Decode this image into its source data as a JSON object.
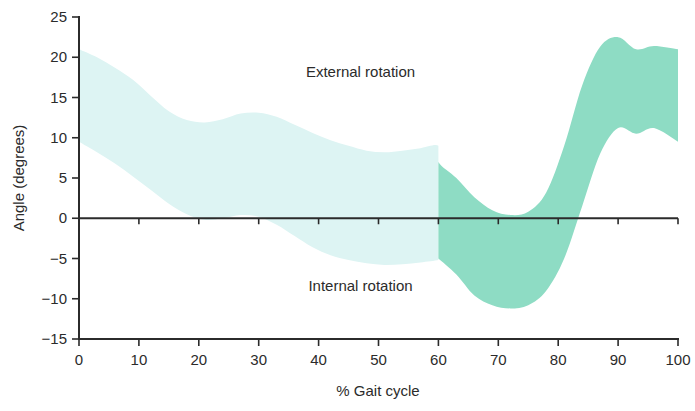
{
  "chart_data": {
    "type": "area",
    "title": "",
    "subtitle": "",
    "xlabel": "% Gait cycle",
    "ylabel": "Angle (degrees)",
    "xlim": [
      0,
      100
    ],
    "ylim": [
      -15,
      25
    ],
    "xticks": [
      0,
      10,
      20,
      30,
      40,
      50,
      60,
      70,
      80,
      90,
      100
    ],
    "xtick_labels": [
      "0",
      "10",
      "20",
      "30",
      "40",
      "50",
      "60",
      "70",
      "80",
      "90",
      "100"
    ],
    "yticks": [
      -15,
      -10,
      -5,
      0,
      5,
      10,
      15,
      20,
      25
    ],
    "ytick_labels": [
      "−15",
      "−10",
      "−5",
      "0",
      "5",
      "10",
      "15",
      "20",
      "25"
    ],
    "grid": false,
    "legend": null,
    "zero_reference_line": 0,
    "annotations": [
      {
        "text": "External rotation",
        "x": 47,
        "y": 17.5,
        "name": "external-rotation-label"
      },
      {
        "text": "Internal rotation",
        "x": 47,
        "y": -9.0,
        "name": "internal-rotation-label"
      }
    ],
    "colors": {
      "band_stance": "#ddf4f3",
      "band_swing": "#8edcc4",
      "axis": "#2b2b2b",
      "text": "#2b2b2b",
      "background": "#ffffff"
    },
    "phase_split_x": 60,
    "series": [
      {
        "name": "Hip/knee rotation normal range (upper bound)",
        "x": [
          0,
          3,
          6,
          9,
          12,
          15,
          18,
          21,
          24,
          27,
          30,
          33,
          36,
          39,
          42,
          45,
          48,
          51,
          54,
          57,
          60,
          60,
          63,
          66,
          69,
          72,
          75,
          78,
          81,
          84,
          87,
          90,
          93,
          96,
          100
        ],
        "values": [
          21.0,
          20.0,
          18.7,
          17.2,
          15.2,
          13.3,
          12.2,
          11.9,
          12.3,
          13.0,
          13.1,
          12.6,
          11.6,
          10.6,
          9.7,
          9.0,
          8.4,
          8.2,
          8.4,
          8.7,
          9.0,
          7.0,
          5.0,
          2.6,
          1.0,
          0.4,
          0.8,
          3.2,
          9.0,
          16.5,
          21.3,
          22.5,
          21.0,
          21.4,
          21.0
        ]
      },
      {
        "name": "Hip/knee rotation normal range (lower bound)",
        "x": [
          0,
          3,
          6,
          9,
          12,
          15,
          18,
          21,
          24,
          27,
          30,
          33,
          36,
          39,
          42,
          45,
          48,
          51,
          54,
          57,
          60,
          60,
          63,
          66,
          69,
          72,
          75,
          78,
          81,
          84,
          87,
          90,
          93,
          96,
          100
        ],
        "values": [
          9.5,
          8.2,
          6.8,
          5.2,
          3.5,
          1.8,
          0.5,
          -0.2,
          0.0,
          0.4,
          0.2,
          -0.8,
          -2.2,
          -3.6,
          -4.6,
          -5.2,
          -5.6,
          -5.8,
          -5.7,
          -5.5,
          -5.2,
          -5.0,
          -7.0,
          -9.6,
          -10.8,
          -11.2,
          -10.8,
          -9.0,
          -5.0,
          1.5,
          8.0,
          11.2,
          10.5,
          11.2,
          9.5
        ]
      }
    ]
  }
}
